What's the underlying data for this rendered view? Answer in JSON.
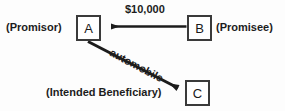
{
  "diagram": {
    "background_color": "#fdfdfd",
    "stroke_color": "#1c1c1c",
    "box_border_color": "#3a3a3a",
    "nodes": [
      {
        "id": "A",
        "letter": "A",
        "role_label": "(Promisor)",
        "x": 76,
        "y": 15,
        "w": 25,
        "h": 26
      },
      {
        "id": "B",
        "letter": "B",
        "role_label": "(Promisee)",
        "x": 187,
        "y": 15,
        "w": 25,
        "h": 26
      },
      {
        "id": "C",
        "letter": "C",
        "role_label": "(Intended Beneficiary)",
        "x": 185,
        "y": 80,
        "w": 25,
        "h": 26
      }
    ],
    "edges": [
      {
        "id": "money",
        "from": "B",
        "to": "A",
        "label": "$10,000",
        "direction": "leftward",
        "arrowhead_at": "A"
      },
      {
        "id": "automobile",
        "from": "A",
        "to": "C",
        "label": "automobile",
        "direction": "down-right-diagonal",
        "arrowhead_at": "C",
        "label_rotation_deg": 28
      }
    ]
  }
}
